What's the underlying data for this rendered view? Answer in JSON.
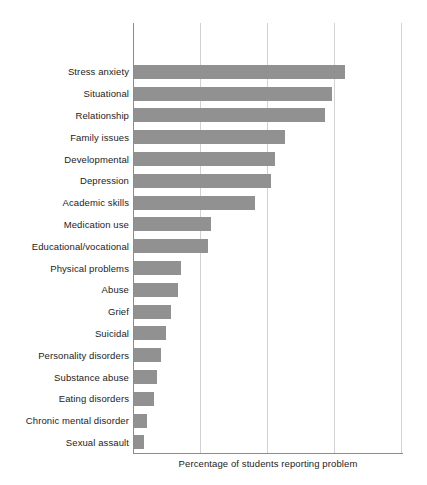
{
  "chart_data": {
    "type": "bar",
    "orientation": "horizontal",
    "title": "",
    "xlabel": "Percentage of students reporting problem",
    "ylabel": "",
    "xlim": [
      0,
      80
    ],
    "ylim": null,
    "grid": "vertical-only",
    "legend": "none",
    "xticks": [
      0,
      20,
      40,
      60,
      80
    ],
    "xtick_labels": [
      "",
      "",
      "",
      "",
      ""
    ],
    "bar_color": "#919191",
    "gridline_color": "#d2d2d2",
    "axis_color": "#8c8c8c",
    "categories": [
      "Stress anxiety",
      "Situational",
      "Relationship",
      "Family issues",
      "Developmental",
      "Depression",
      "Academic skills",
      "Medication use",
      "Educational/vocational",
      "Physical problems",
      "Abuse",
      "Grief",
      "Suicidal",
      "Personality disorders",
      "Substance abuse",
      "Eating disorders",
      "Chronic mental disorder",
      "Sexual assault"
    ],
    "values": [
      63,
      59,
      57,
      45,
      42,
      41,
      36,
      23,
      22,
      14,
      13,
      11,
      9.5,
      8,
      7,
      6,
      4,
      3
    ]
  }
}
